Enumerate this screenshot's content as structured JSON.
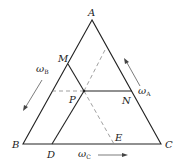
{
  "diagram": {
    "type": "ternary-phase-diagram",
    "vertices": {
      "A": {
        "label": "A",
        "x": 92,
        "y": 20
      },
      "B": {
        "label": "B",
        "x": 23,
        "y": 144
      },
      "C": {
        "label": "C",
        "x": 161,
        "y": 144
      }
    },
    "points": {
      "M": {
        "label": "M",
        "x": 68,
        "y": 64
      },
      "P": {
        "label": "P",
        "x": 84,
        "y": 91
      },
      "N": {
        "label": "N",
        "x": 132,
        "y": 91
      },
      "D": {
        "label": "D",
        "x": 52,
        "y": 144
      },
      "E": {
        "label": "E",
        "x": 114,
        "y": 144
      }
    },
    "axes": {
      "omega_A": {
        "symbol": "ω",
        "subscript": "A",
        "direction": "toward A along CA"
      },
      "omega_B": {
        "symbol": "ω",
        "subscript": "B",
        "direction": "toward B along AB"
      },
      "omega_C": {
        "symbol": "ω",
        "subscript": "C",
        "direction": "toward C along BC"
      }
    },
    "solid_lines": [
      "AB",
      "BC",
      "CA",
      "PM",
      "PN",
      "PD"
    ],
    "dashed_lines": [
      "P to AB (horizontal)",
      "P to AC (parallel to AB)",
      "PE"
    ],
    "colors": {
      "line": "#222222",
      "dashed": "#777777",
      "background": "#ffffff"
    }
  }
}
